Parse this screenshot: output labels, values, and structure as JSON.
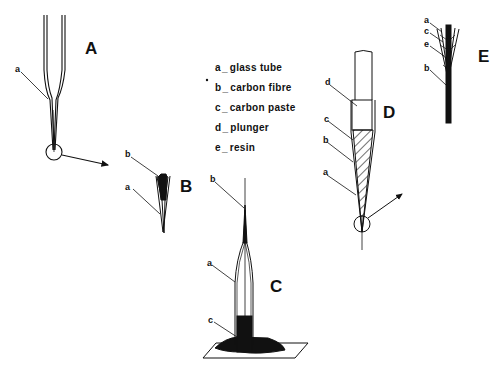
{
  "figure": {
    "panels": [
      {
        "id": "A",
        "label": "A"
      },
      {
        "id": "B",
        "label": "B"
      },
      {
        "id": "C",
        "label": "C"
      },
      {
        "id": "D",
        "label": "D"
      },
      {
        "id": "E",
        "label": "E"
      }
    ],
    "legend": [
      {
        "key": "a",
        "sep": "_",
        "text": "glass tube"
      },
      {
        "key": "b",
        "sep": "_",
        "text": "carbon fibre"
      },
      {
        "key": "c",
        "sep": "_",
        "text": "carbon paste"
      },
      {
        "key": "d",
        "sep": "_",
        "text": "plunger"
      },
      {
        "key": "e",
        "sep": "_",
        "text": "resin"
      }
    ],
    "part_labels": {
      "A": [
        "a"
      ],
      "B": [
        "b",
        "a"
      ],
      "C": [
        "b",
        "a",
        "c"
      ],
      "D": [
        "d",
        "c",
        "b",
        "a"
      ],
      "E": [
        "a",
        "c",
        "e",
        "b"
      ]
    },
    "colors": {
      "ink": "#111111",
      "background": "#ffffff"
    }
  }
}
